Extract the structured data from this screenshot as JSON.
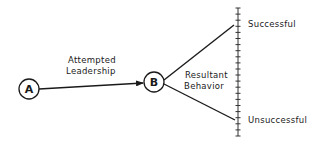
{
  "diagram": {
    "nodes": [
      {
        "id": "A",
        "label": "A",
        "cx": 29,
        "cy": 89,
        "r": 10
      },
      {
        "id": "B",
        "label": "B",
        "cx": 154,
        "cy": 82,
        "r": 10
      }
    ],
    "edges": [
      {
        "from": "A",
        "to": "B",
        "label_line1": "Attempted",
        "label_line2": "Leadership"
      }
    ],
    "branch_label_line1": "Resultant",
    "branch_label_line2": "Behavior",
    "scale": {
      "top_label": "Successful",
      "bottom_label": "Unsuccessful",
      "x": 238,
      "y_top": 8,
      "y_bottom": 136,
      "tick_count": 22
    },
    "colors": {
      "ink": "#1a1a1a",
      "background": "#ffffff"
    }
  }
}
